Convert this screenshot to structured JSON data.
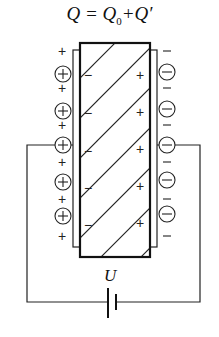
{
  "formula": {
    "q": "Q",
    "eq": " = ",
    "q0": "Q",
    "q0_sub": "0",
    "plus": "+",
    "qprime": "Q′"
  },
  "battery_label": "U",
  "diagram": {
    "left_plate_charge": "+",
    "right_plate_charge": "−",
    "dielectric_left_surface_charge": "−",
    "dielectric_right_surface_charge": "+",
    "left_free_charges_circled": [
      "+",
      "+",
      "+",
      "+",
      "+"
    ],
    "right_free_charges_circled": [
      "−",
      "−",
      "−",
      "−",
      "−"
    ],
    "colors": {
      "line": "#111111",
      "background": "#ffffff"
    }
  }
}
